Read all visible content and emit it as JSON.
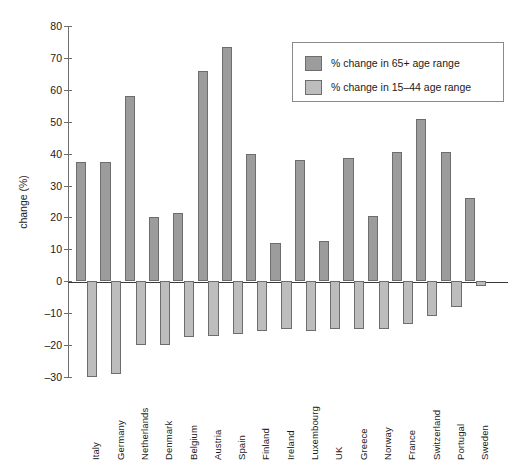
{
  "chart_data": {
    "type": "bar",
    "title": "",
    "xlabel": "",
    "ylabel": "change (%)",
    "ylim": [
      -30,
      80
    ],
    "yticks": [
      80,
      70,
      60,
      50,
      40,
      30,
      20,
      10,
      0,
      -10,
      -20,
      -30
    ],
    "ytick_labels": [
      "80",
      "70",
      "60",
      "50",
      "40",
      "30",
      "20",
      "10",
      "0",
      "–10",
      "–20",
      "–30"
    ],
    "grid": false,
    "legend_position": "upper right",
    "categories": [
      "Italy",
      "Germany",
      "Netherlands",
      "Denmark",
      "Belgium",
      "Austria",
      "Spain",
      "Finland",
      "Ireland",
      "Luxembourg",
      "UK",
      "Greece",
      "Norway",
      "France",
      "Switzerland",
      "Portugal",
      "Sweden"
    ],
    "series": [
      {
        "name": "% change in 65+ age range",
        "color": "#9c9c9c",
        "values": [
          37.5,
          37.5,
          58,
          20,
          21.5,
          66,
          73.5,
          40,
          12,
          38,
          12.5,
          38.5,
          20.5,
          40.5,
          51,
          40.5,
          26
        ]
      },
      {
        "name": "% change in 15–44 age range",
        "color": "#bdbdbd",
        "values": [
          -30,
          -29,
          -20,
          -20,
          -17.5,
          -17,
          -16.5,
          -15.5,
          -15,
          -15.5,
          -15,
          -15,
          -15,
          -13.5,
          -11,
          -8,
          -1.5
        ]
      }
    ]
  },
  "legend": {
    "items": [
      {
        "label": "% change in 65+ age range",
        "swatch": "pos"
      },
      {
        "label": "% change in 15–44 age range",
        "swatch": "neg"
      }
    ]
  },
  "axis": {
    "y_title": "change (%)"
  }
}
